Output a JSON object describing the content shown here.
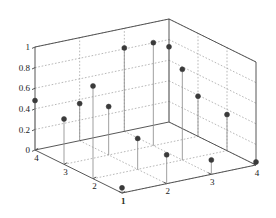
{
  "figure": {
    "title": "",
    "background": "#ffffff",
    "axis_color": "#444444",
    "grid_color": "#9a9a9a",
    "stem_color": "#8f8f8f",
    "marker_color": "#3a3a3a"
  },
  "chart_data": {
    "type": "scatter",
    "subtype": "stem3",
    "title": "",
    "xlabel": "",
    "ylabel": "",
    "zlabel": "",
    "xlim": [
      1,
      4
    ],
    "ylim": [
      1,
      4
    ],
    "zlim": [
      0,
      1
    ],
    "grid": true,
    "legend": null,
    "x_ticks": [
      1,
      2,
      3,
      4
    ],
    "x_tick_labels": [
      "1",
      "2",
      "3",
      "4"
    ],
    "y_ticks": [
      4,
      3,
      2,
      1
    ],
    "y_tick_labels": [
      "4",
      "3",
      "2",
      "1"
    ],
    "z_ticks": [
      0,
      0.2,
      0.4,
      0.6,
      0.8,
      1
    ],
    "z_tick_labels": [
      "0",
      "0.2",
      "0.4",
      "0.6",
      "0.8",
      "1"
    ],
    "points": [
      {
        "x": 1,
        "y": 4,
        "z": 0.48
      },
      {
        "x": 2,
        "y": 4,
        "z": 0.36
      },
      {
        "x": 3,
        "y": 4,
        "z": 0.81
      },
      {
        "x": 4,
        "y": 4,
        "z": 0.73
      },
      {
        "x": 1,
        "y": 3,
        "z": 0.44
      },
      {
        "x": 2,
        "y": 3,
        "z": 0.47
      },
      {
        "x": 3,
        "y": 3,
        "z": 1.0
      },
      {
        "x": 4,
        "y": 3,
        "z": 0.39
      },
      {
        "x": 1,
        "y": 2,
        "z": 0.9
      },
      {
        "x": 2,
        "y": 2,
        "z": 0.3
      },
      {
        "x": 3,
        "y": 2,
        "z": 0.88
      },
      {
        "x": 4,
        "y": 2,
        "z": 0.35
      },
      {
        "x": 1,
        "y": 1,
        "z": 0.05
      },
      {
        "x": 2,
        "y": 1,
        "z": 0.28
      },
      {
        "x": 3,
        "y": 1,
        "z": 0.14
      },
      {
        "x": 4,
        "y": 1,
        "z": 0.03
      }
    ]
  }
}
